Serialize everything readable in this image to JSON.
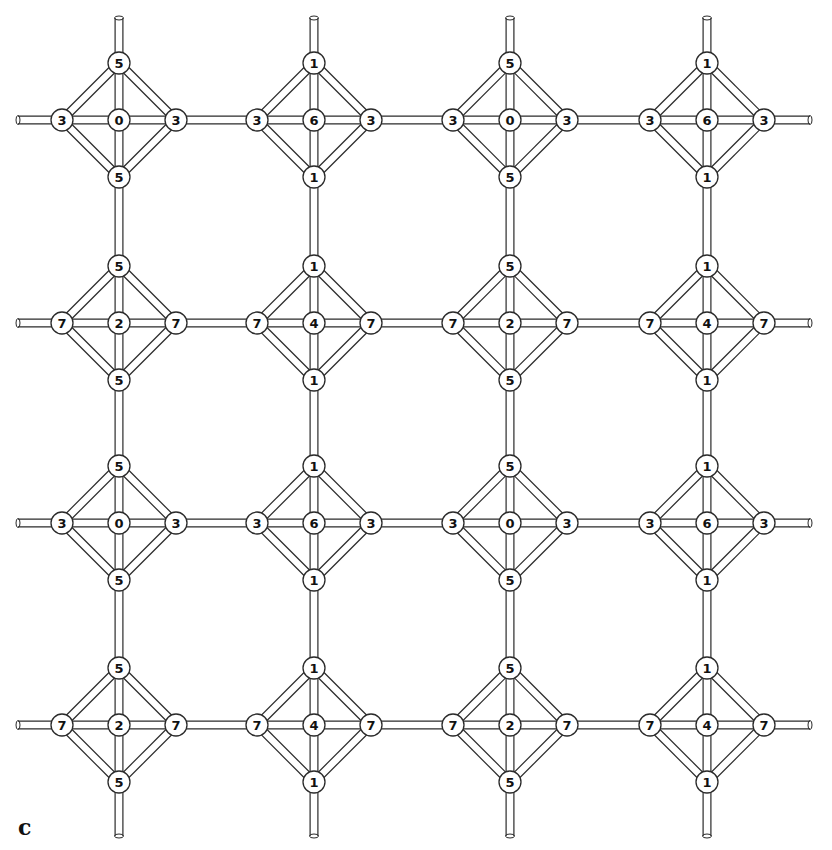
{
  "figure": {
    "panel_label": "c",
    "colors": {
      "background": "#ffffff",
      "line": "#2a2a2a",
      "text": "#111111"
    }
  },
  "layout": {
    "columns_x": [
      119,
      314,
      510,
      707
    ],
    "rows_y": [
      120,
      323,
      523,
      725
    ],
    "diamond_radius": 57,
    "node_radius": 11,
    "rod_width": 9,
    "horizontal_rod_extent": [
      18,
      810
    ],
    "vertical_rod_extent": [
      18,
      836
    ]
  },
  "clusters": [
    {
      "row": 0,
      "col": 0,
      "top": "5",
      "left": "3",
      "center": "0",
      "right": "3",
      "bottom": "5"
    },
    {
      "row": 0,
      "col": 1,
      "top": "1",
      "left": "3",
      "center": "6",
      "right": "3",
      "bottom": "1"
    },
    {
      "row": 0,
      "col": 2,
      "top": "5",
      "left": "3",
      "center": "0",
      "right": "3",
      "bottom": "5"
    },
    {
      "row": 0,
      "col": 3,
      "top": "1",
      "left": "3",
      "center": "6",
      "right": "3",
      "bottom": "1"
    },
    {
      "row": 1,
      "col": 0,
      "top": "5",
      "left": "7",
      "center": "2",
      "right": "7",
      "bottom": "5"
    },
    {
      "row": 1,
      "col": 1,
      "top": "1",
      "left": "7",
      "center": "4",
      "right": "7",
      "bottom": "1"
    },
    {
      "row": 1,
      "col": 2,
      "top": "5",
      "left": "7",
      "center": "2",
      "right": "7",
      "bottom": "5"
    },
    {
      "row": 1,
      "col": 3,
      "top": "1",
      "left": "7",
      "center": "4",
      "right": "7",
      "bottom": "1"
    },
    {
      "row": 2,
      "col": 0,
      "top": "5",
      "left": "3",
      "center": "0",
      "right": "3",
      "bottom": "5"
    },
    {
      "row": 2,
      "col": 1,
      "top": "1",
      "left": "3",
      "center": "6",
      "right": "3",
      "bottom": "1"
    },
    {
      "row": 2,
      "col": 2,
      "top": "5",
      "left": "3",
      "center": "0",
      "right": "3",
      "bottom": "5"
    },
    {
      "row": 2,
      "col": 3,
      "top": "1",
      "left": "3",
      "center": "6",
      "right": "3",
      "bottom": "1"
    },
    {
      "row": 3,
      "col": 0,
      "top": "5",
      "left": "7",
      "center": "2",
      "right": "7",
      "bottom": "5"
    },
    {
      "row": 3,
      "col": 1,
      "top": "1",
      "left": "7",
      "center": "4",
      "right": "7",
      "bottom": "1"
    },
    {
      "row": 3,
      "col": 2,
      "top": "5",
      "left": "7",
      "center": "2",
      "right": "7",
      "bottom": "5"
    },
    {
      "row": 3,
      "col": 3,
      "top": "1",
      "left": "7",
      "center": "4",
      "right": "7",
      "bottom": "1"
    }
  ]
}
